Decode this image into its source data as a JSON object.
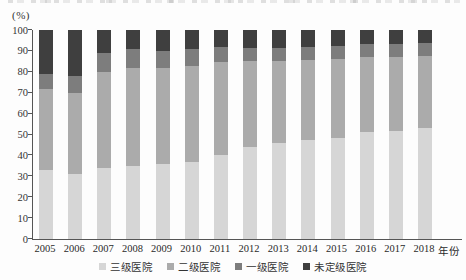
{
  "chart_data": {
    "type": "bar",
    "subtype": "stacked-percentage-column",
    "title": "",
    "unit_label": "(%)",
    "x_axis_label": "年份",
    "categories": [
      "2005",
      "2006",
      "2007",
      "2008",
      "2009",
      "2010",
      "2011",
      "2012",
      "2013",
      "2014",
      "2015",
      "2016",
      "2017",
      "2018"
    ],
    "series": [
      {
        "name": "三级医院",
        "color": "#d6d6d6",
        "values": [
          33,
          31,
          34,
          35,
          36,
          37,
          40,
          44,
          46,
          47.5,
          48.5,
          51,
          51.5,
          53
        ]
      },
      {
        "name": "二级医院",
        "color": "#ababab",
        "values": [
          39,
          39,
          46,
          47,
          46,
          46,
          44.5,
          41,
          39,
          38,
          37.5,
          36,
          35.5,
          34.5
        ]
      },
      {
        "name": "一级医院",
        "color": "#7d7d7d",
        "values": [
          7,
          8,
          9,
          9,
          8,
          8,
          7.5,
          6.5,
          6.2,
          6.5,
          6.5,
          6.5,
          6.5,
          6.5
        ]
      },
      {
        "name": "未定级医院",
        "color": "#3f3f3f",
        "values": [
          21,
          22,
          11,
          9,
          10,
          9,
          8,
          8.5,
          8.8,
          8,
          7.5,
          6.5,
          6.5,
          6
        ]
      }
    ],
    "y_ticks": [
      0,
      10,
      20,
      30,
      40,
      50,
      60,
      70,
      80,
      90,
      100
    ],
    "ylim": [
      0,
      100
    ],
    "grid": false,
    "legend_position": "bottom",
    "axis_color": "#555555"
  }
}
